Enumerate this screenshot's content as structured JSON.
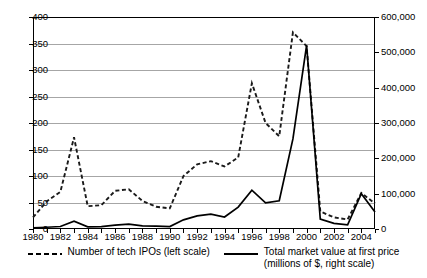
{
  "chart_data": {
    "type": "line",
    "title": "",
    "xlabel": "",
    "grid": true,
    "legend_position": "bottom",
    "x": [
      1980,
      1981,
      1982,
      1983,
      1984,
      1985,
      1986,
      1987,
      1988,
      1989,
      1990,
      1991,
      1992,
      1993,
      1994,
      1995,
      1996,
      1997,
      1998,
      1999,
      2000,
      2001,
      2002,
      2003,
      2004,
      2005
    ],
    "x_tick_labels": [
      "1980",
      "1982",
      "1984",
      "1986",
      "1988",
      "1990",
      "1992",
      "1994",
      "1996",
      "1998",
      "2000",
      "2002",
      "2004"
    ],
    "xlim": [
      1980,
      2005
    ],
    "axes": [
      {
        "id": "left",
        "ylabel": "Number of tech IPOs",
        "ylim": [
          0,
          400
        ],
        "ticks": [
          "0",
          "50",
          "100",
          "150",
          "200",
          "250",
          "300",
          "350",
          "400"
        ],
        "tick_values": [
          0,
          50,
          100,
          150,
          200,
          250,
          300,
          350,
          400
        ]
      },
      {
        "id": "right",
        "ylabel": "Total market value at first price (millions of $)",
        "ylim": [
          0,
          600000
        ],
        "ticks": [
          "0",
          "100,000",
          "200,000",
          "300,000",
          "400,000",
          "500,000",
          "600,000"
        ],
        "tick_values": [
          0,
          100000,
          200000,
          300000,
          400000,
          500000,
          600000
        ]
      }
    ],
    "series": [
      {
        "name": "Number of tech IPOs (left scale)",
        "axis": "left",
        "style": "dashed",
        "color": "#1a1a1a",
        "values": [
          22,
          52,
          70,
          173,
          43,
          45,
          72,
          75,
          53,
          42,
          39,
          100,
          122,
          128,
          118,
          135,
          275,
          200,
          175,
          371,
          345,
          33,
          22,
          18,
          68,
          48
        ]
      },
      {
        "name": "Total market value at first price (millions of $, right scale)",
        "axis": "right",
        "style": "solid",
        "color": "#000000",
        "values": [
          3000,
          5000,
          7000,
          22000,
          6000,
          7000,
          11000,
          14000,
          9000,
          8000,
          7000,
          26000,
          37000,
          42000,
          34000,
          62000,
          110000,
          74000,
          80000,
          255000,
          520000,
          28000,
          16000,
          12000,
          100000,
          48000
        ]
      }
    ]
  },
  "legend": {
    "items": [
      {
        "label": "Number of tech IPOs (left scale)",
        "style": "dashed"
      },
      {
        "label": "Total market value at first price\n(millions of $, right scale)",
        "style": "solid"
      }
    ]
  }
}
